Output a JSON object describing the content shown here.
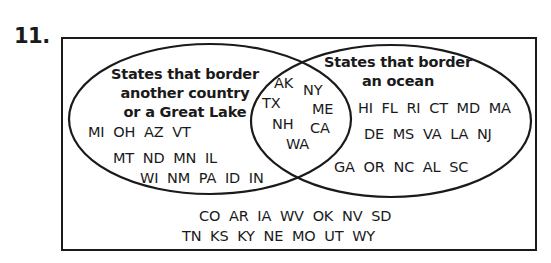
{
  "problem": {
    "number": "11."
  },
  "venn": {
    "left_set": {
      "label_lines": [
        "States that border",
        "another country",
        "or a Great Lake"
      ],
      "only": [
        [
          "MI",
          "OH",
          "AZ",
          "VT"
        ],
        [
          "MT",
          "ND",
          "MN",
          "IL"
        ],
        [
          "WI",
          "NM",
          "PA",
          "ID",
          "IN"
        ]
      ]
    },
    "right_set": {
      "label_lines": [
        "States that border",
        "an ocean"
      ],
      "only": [
        [
          "HI",
          "FL",
          "RI",
          "CT",
          "MD",
          "MA"
        ],
        [
          "DE",
          "MS",
          "VA",
          "LA",
          "NJ"
        ],
        [
          "GA",
          "OR",
          "NC",
          "AL",
          "SC"
        ]
      ]
    },
    "intersection": [
      "AK",
      "NY",
      "TX",
      "ME",
      "NH",
      "CA",
      "WA"
    ],
    "outside": [
      [
        "CO",
        "AR",
        "IA",
        "WV",
        "OK",
        "NV",
        "SD"
      ],
      [
        "TN",
        "KS",
        "KY",
        "NE",
        "MO",
        "UT",
        "WY"
      ]
    ],
    "line_color": "#1a1a1a"
  },
  "text": {
    "left_title_1": "States that border",
    "left_title_2": "another country",
    "left_title_3": "or a Great Lake",
    "right_title_1": "States that border",
    "right_title_2": "an ocean",
    "left_row_1": "MI  OH  AZ  VT",
    "left_row_2": "MT  ND  MN  IL",
    "left_row_3": "WI  NM  PA  ID  IN",
    "right_row_1": "HI  FL  RI  CT  MD  MA",
    "right_row_2": "DE  MS  VA  LA  NJ",
    "right_row_3": "GA  OR  NC  AL  SC",
    "mid_AK": "AK",
    "mid_NY": "NY",
    "mid_TX": "TX",
    "mid_ME": "ME",
    "mid_NH": "NH",
    "mid_CA": "CA",
    "mid_WA": "WA",
    "outside_row_1": "CO  AR  IA  WV  OK  NV  SD",
    "outside_row_2": "TN  KS  KY  NE  MO  UT  WY"
  }
}
